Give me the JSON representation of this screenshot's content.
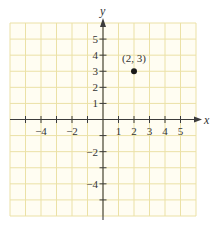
{
  "chart_data": {
    "type": "scatter",
    "title": "",
    "xlabel": "x",
    "ylabel": "y",
    "xlim": [
      -6,
      6
    ],
    "ylim": [
      -6,
      6
    ],
    "grid": true,
    "x_tick_labels": [
      "-4",
      "-2",
      "1",
      "2",
      "3",
      "4",
      "5"
    ],
    "x_tick_values": [
      -4,
      -2,
      1,
      2,
      3,
      4,
      5
    ],
    "x_ticks_marked": [
      -5,
      -4,
      -3,
      -2,
      -1,
      1,
      2,
      3,
      4,
      5
    ],
    "y_tick_labels": [
      "5",
      "4",
      "3",
      "2",
      "1",
      "-2",
      "-4"
    ],
    "y_tick_values": [
      5,
      4,
      3,
      2,
      1,
      -2,
      -4
    ],
    "y_ticks_marked": [
      5,
      4,
      3,
      2,
      1,
      -1,
      -2,
      -3,
      -4,
      -5
    ],
    "series": [
      {
        "name": "point",
        "points": [
          {
            "x": 2,
            "y": 3,
            "label": "(2, 3)"
          }
        ]
      }
    ],
    "colors": {
      "background": "#fffdf2",
      "grid": "#ebe1a6",
      "axis": "#3c3c3c",
      "point": "#1a1a1a"
    }
  },
  "labels": {
    "x_axis": "x",
    "y_axis": "y",
    "point": "(2, 3)"
  }
}
